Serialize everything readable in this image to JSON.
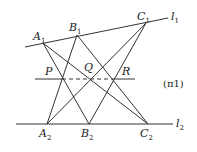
{
  "diagram": {
    "plane_label": "(π1)",
    "lines": {
      "l1": {
        "label": "l",
        "sub": "1"
      },
      "l2": {
        "label": "l",
        "sub": "2"
      }
    },
    "points": {
      "A1": {
        "label": "A",
        "sub": "1",
        "x": 43,
        "y": 43
      },
      "B1": {
        "label": "B",
        "sub": "1",
        "x": 77,
        "y": 35
      },
      "C1": {
        "label": "C",
        "sub": "1",
        "x": 146,
        "y": 23
      },
      "A2": {
        "label": "A",
        "sub": "2",
        "x": 47,
        "y": 124
      },
      "B2": {
        "label": "B",
        "sub": "2",
        "x": 89,
        "y": 124
      },
      "C2": {
        "label": "C",
        "sub": "2",
        "x": 148,
        "y": 124
      },
      "P": {
        "label": "P",
        "x": 62,
        "y": 79
      },
      "Q": {
        "label": "Q",
        "x": 91,
        "y": 79
      },
      "R": {
        "label": "R",
        "x": 113,
        "y": 79
      }
    },
    "segments": [
      "A1-B2",
      "A1-C2",
      "B1-A2",
      "B1-C2",
      "C1-A2",
      "C1-B2"
    ],
    "axis_line": {
      "style": "solid outside, dashed between P and R"
    }
  }
}
